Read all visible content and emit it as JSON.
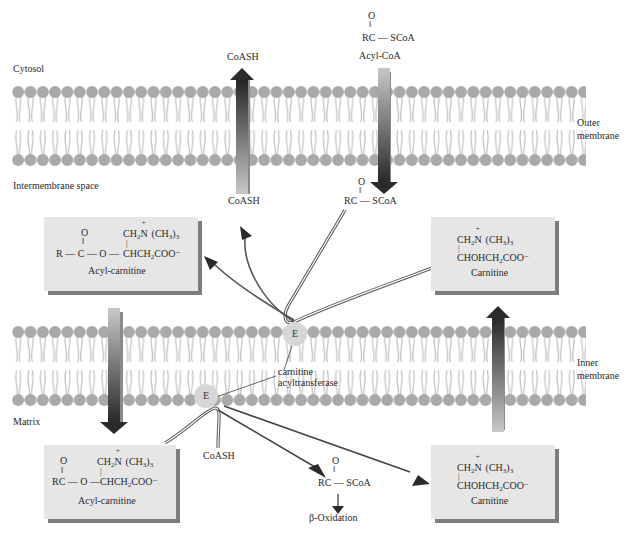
{
  "regions": {
    "cytosol": "Cytosol",
    "intermembrane": "Intermembrane space",
    "matrix": "Matrix"
  },
  "membranes": {
    "outer": {
      "line1": "Outer",
      "line2": "membrane"
    },
    "inner": {
      "line1": "Inner",
      "line2": "membrane"
    }
  },
  "top": {
    "coash_out": "CoASH",
    "acyl_coa_o": "O",
    "acyl_coa_formula": "RC — SCoA",
    "acyl_coa_name": "Acyl-CoA"
  },
  "intermembrane_labels": {
    "coash": "CoASH",
    "acyl_coa_o": "O",
    "acyl_coa_formula": "RC — SCoA"
  },
  "boxes": {
    "acyl_carnitine_top": {
      "o": "O",
      "line1": "CH2N(CH3)3",
      "line2_left": "R — C — O —",
      "line2_right": "CHCH2COO⁻",
      "name": "Acyl-carnitine"
    },
    "carnitine_top": {
      "line1": "CH2N(CH3)3",
      "line2": "CHOHCH2COO⁻",
      "name": "Carnitine"
    },
    "acyl_carnitine_bottom": {
      "o": "O",
      "line1": "CH2N(CH3)3",
      "line2_left": "RC — O —",
      "line2_right": "CHCH2COO⁻",
      "name": "Acyl-carnitine"
    },
    "carnitine_bottom": {
      "line1": "CH2N(CH3)3",
      "line2": "CHOHCH2COO⁻",
      "name": "Carnitine"
    }
  },
  "enzyme": {
    "symbol": "E",
    "name_line1": "carnitine",
    "name_line2": "acyltransferase"
  },
  "matrix_labels": {
    "coash": "CoASH",
    "acyl_coa_o": "O",
    "acyl_coa_formula": "RC — SCoA",
    "beta_oxidation": "β-Oxidation"
  },
  "colors": {
    "membrane_head": "#a9a9a9",
    "membrane_tail": "#c4c4c4",
    "box_fill": "#e6e6e6",
    "box_shadow": "#7d7d7d",
    "arrow_dark": "#2b2b2b",
    "arrow_light": "#bdbdbd"
  }
}
